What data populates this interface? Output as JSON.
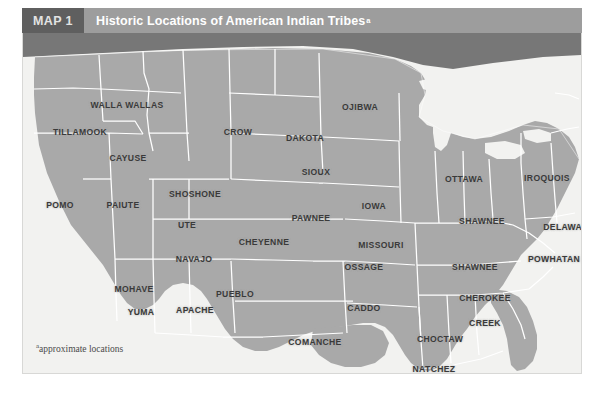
{
  "header": {
    "badge": "MAP 1",
    "title": "Historic Locations of American Indian Tribes",
    "title_superscript": "a"
  },
  "footnote": {
    "marker": "a",
    "text": "approximate locations"
  },
  "colors": {
    "header_bar": "#9d9d9d",
    "header_badge": "#5f5f5f",
    "header_text": "#ffffff",
    "badge_text": "#e3e3e3",
    "land": "#a9a9a9",
    "canada": "#777777",
    "water": "#f2f2f0",
    "state_border": "#ffffff",
    "label_text": "#3a3a3a",
    "page_background": "#ffffff",
    "plate_background": "#f4f4f2"
  },
  "map": {
    "title": "Historic Locations of American Indian Tribes",
    "region": "Continental United States",
    "label_count": 31,
    "labels": [
      {
        "name": "WALLA WALLAS",
        "x": 104,
        "y": 72
      },
      {
        "name": "TILLAMOOK",
        "x": 57,
        "y": 99
      },
      {
        "name": "CAYUSE",
        "x": 105,
        "y": 125
      },
      {
        "name": "POMO",
        "x": 37,
        "y": 172
      },
      {
        "name": "PAIUTE",
        "x": 100,
        "y": 172
      },
      {
        "name": "SHOSHONE",
        "x": 172,
        "y": 161
      },
      {
        "name": "CROW",
        "x": 215,
        "y": 99
      },
      {
        "name": "DAKOTA",
        "x": 282,
        "y": 105
      },
      {
        "name": "SIOUX",
        "x": 293,
        "y": 139
      },
      {
        "name": "OJIBWA",
        "x": 337,
        "y": 74
      },
      {
        "name": "IOWA",
        "x": 351,
        "y": 173
      },
      {
        "name": "UTE",
        "x": 164,
        "y": 192
      },
      {
        "name": "NAVAJO",
        "x": 171,
        "y": 226
      },
      {
        "name": "MOHAVE",
        "x": 111,
        "y": 256
      },
      {
        "name": "YUMA",
        "x": 118,
        "y": 279
      },
      {
        "name": "APACHE",
        "x": 172,
        "y": 277
      },
      {
        "name": "PUEBLO",
        "x": 212,
        "y": 261
      },
      {
        "name": "CHEYENNE",
        "x": 241,
        "y": 209
      },
      {
        "name": "PAWNEE",
        "x": 288,
        "y": 185
      },
      {
        "name": "MISSOURI",
        "x": 358,
        "y": 212
      },
      {
        "name": "OSSAGE",
        "x": 341,
        "y": 234
      },
      {
        "name": "CADDO",
        "x": 341,
        "y": 275
      },
      {
        "name": "COMANCHE",
        "x": 292,
        "y": 309
      },
      {
        "name": "OTTAWA",
        "x": 441,
        "y": 146
      },
      {
        "name": "IROQUOIS",
        "x": 524,
        "y": 145
      },
      {
        "name": "SHAWNEE",
        "x": 459,
        "y": 188
      },
      {
        "name": "SHAWNEE",
        "x": 452,
        "y": 234
      },
      {
        "name": "DELAWARE",
        "x": 546,
        "y": 194
      },
      {
        "name": "POWHATAN",
        "x": 531,
        "y": 226
      },
      {
        "name": "CHEROKEE",
        "x": 462,
        "y": 265
      },
      {
        "name": "CREEK",
        "x": 462,
        "y": 290
      },
      {
        "name": "CHOCTAW",
        "x": 417,
        "y": 306
      },
      {
        "name": "NATCHEZ",
        "x": 411,
        "y": 336
      },
      {
        "name": "SEMINOLE",
        "x": 506,
        "y": 377
      }
    ]
  }
}
